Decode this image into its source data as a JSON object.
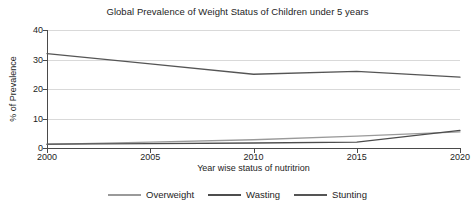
{
  "chart_data": {
    "type": "line",
    "title": "Global Prevalence of Weight Status of Children under 5 years",
    "xlabel": "Year wise status of nutritrion",
    "ylabel": "% of Prevalence",
    "categories": [
      "2000",
      "2005",
      "2010",
      "2015",
      "2020"
    ],
    "x": [
      2000,
      2005,
      2010,
      2015,
      2020
    ],
    "xlim": [
      2000,
      2020
    ],
    "ylim": [
      0,
      40
    ],
    "yticks": [
      "0",
      "10",
      "20",
      "30",
      "40"
    ],
    "ytick_values": [
      0,
      10,
      20,
      30,
      40
    ],
    "grid": "horizontal",
    "legend_position": "bottom",
    "series": [
      {
        "name": "Overweight",
        "color": "#9a9a9a",
        "values": [
          1.2,
          2.0,
          2.8,
          4.0,
          5.5
        ]
      },
      {
        "name": "Wasting",
        "color": "#4d4d4d",
        "values": [
          1.3,
          1.5,
          1.7,
          2.0,
          6.0
        ]
      },
      {
        "name": "Stunting",
        "color": "#555555",
        "values": [
          32.0,
          28.5,
          25.0,
          26.0,
          24.0
        ]
      }
    ]
  }
}
